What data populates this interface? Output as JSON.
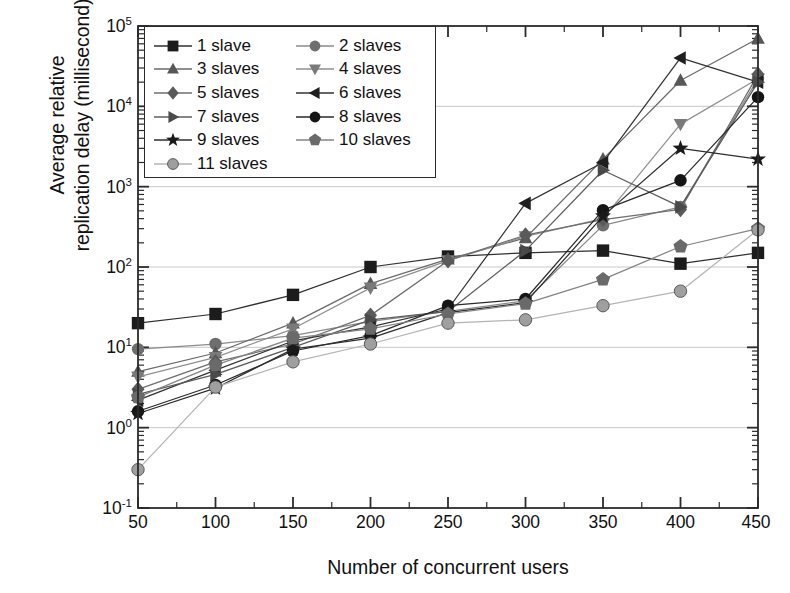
{
  "chart_data": {
    "type": "line",
    "title": "",
    "xlabel": "Number of concurrent users",
    "ylabel_line1": "Average relative",
    "ylabel_line2": "replication delay (millisecond)",
    "x": [
      50,
      100,
      150,
      200,
      250,
      300,
      350,
      400,
      450
    ],
    "xlim": [
      50,
      450
    ],
    "ylim": [
      0.1,
      100000
    ],
    "yscale": "log",
    "xticks": [
      "50",
      "100",
      "150",
      "200",
      "250",
      "300",
      "350",
      "400",
      "450"
    ],
    "yticks": [
      "10⁻¹",
      "10⁰",
      "10¹",
      "10²",
      "10³",
      "10⁴",
      "10⁵"
    ],
    "ytick_exponents": [
      "-1",
      "0",
      "1",
      "2",
      "3",
      "4",
      "5"
    ],
    "grid": "horizontal-decades",
    "legend_position": "upper-left-inside",
    "legend_columns": 2,
    "series": [
      {
        "name": "1 slave",
        "marker": "square",
        "color": "#1c1c1c",
        "line_color": "#303030",
        "values": [
          20,
          26,
          45,
          100,
          135,
          150,
          160,
          110,
          150
        ]
      },
      {
        "name": "2 slaves",
        "marker": "circle",
        "color": "#6e6e6e",
        "line_color": "#8a8a8a",
        "values": [
          9.5,
          11,
          14,
          21,
          28,
          38,
          330,
          560,
          22000
        ]
      },
      {
        "name": "3 slaves",
        "marker": "triangle-up",
        "color": "#575757",
        "line_color": "#6a6a6a",
        "values": [
          5.0,
          8.5,
          20,
          62,
          125,
          230,
          2200,
          21000,
          70000
        ]
      },
      {
        "name": "4 slaves",
        "marker": "triangle-down",
        "color": "#7a7a7a",
        "line_color": "#909090",
        "values": [
          4.3,
          7.5,
          17,
          55,
          120,
          240,
          400,
          6000,
          22000
        ]
      },
      {
        "name": "5 slaves",
        "marker": "diamond",
        "color": "#5a5a5a",
        "line_color": "#6e6e6e",
        "values": [
          3.0,
          6.6,
          11,
          25,
          120,
          250,
          390,
          520,
          25000
        ]
      },
      {
        "name": "6 slaves",
        "marker": "triangle-left",
        "color": "#1f1f1f",
        "line_color": "#333333",
        "values": [
          2.2,
          5.2,
          12,
          18,
          30,
          620,
          2000,
          40000,
          20000
        ]
      },
      {
        "name": "7 slaves",
        "marker": "triangle-right",
        "color": "#4a4a4a",
        "line_color": "#5c5c5c",
        "values": [
          2.6,
          4.6,
          10,
          22,
          28,
          160,
          1600,
          560,
          20000
        ]
      },
      {
        "name": "8 slaves",
        "marker": "circle-dark",
        "color": "#151515",
        "line_color": "#2a2a2a",
        "values": [
          1.6,
          3.4,
          9.0,
          14,
          33,
          40,
          510,
          1200,
          13000
        ]
      },
      {
        "name": "9 slaves",
        "marker": "star",
        "color": "#1a1a1a",
        "line_color": "#2e2e2e",
        "values": [
          1.5,
          3.1,
          9.5,
          13,
          27,
          36,
          430,
          3000,
          2200
        ]
      },
      {
        "name": "10 slaves",
        "marker": "pentagon",
        "color": "#6a6a6a",
        "line_color": "#848484",
        "values": [
          2.4,
          6.0,
          13,
          17,
          26,
          35,
          70,
          180,
          300
        ]
      },
      {
        "name": "11 slaves",
        "marker": "circle-light",
        "color": "#9f9f9f",
        "line_color": "#b4b4b4",
        "values": [
          0.3,
          3.2,
          6.6,
          11,
          20,
          22,
          33,
          50,
          290
        ]
      }
    ]
  },
  "legend": {
    "items": [
      {
        "label": "1 slave"
      },
      {
        "label": "2 slaves"
      },
      {
        "label": "3 slaves"
      },
      {
        "label": "4 slaves"
      },
      {
        "label": "5 slaves"
      },
      {
        "label": "6 slaves"
      },
      {
        "label": "7 slaves"
      },
      {
        "label": "8 slaves"
      },
      {
        "label": "9 slaves"
      },
      {
        "label": "10 slaves"
      },
      {
        "label": "11 slaves"
      }
    ]
  },
  "axes": {
    "x_label": "Number of concurrent users",
    "y_label_line1": "Average relative",
    "y_label_line2": "replication delay (millisecond)"
  },
  "colors": {
    "frame": "#2b2b2b",
    "grid": "#c9c9c9",
    "background": "#ffffff",
    "text": "#111111"
  }
}
